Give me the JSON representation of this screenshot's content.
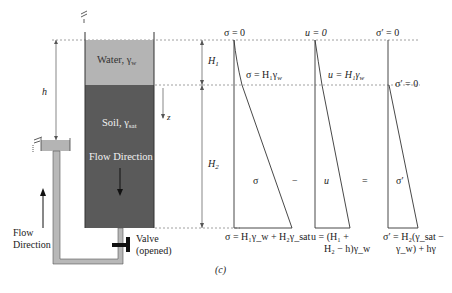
{
  "figure": {
    "caption": "(c)",
    "tank": {
      "water_label": "Water, γ",
      "water_sub": "w",
      "soil_label": "Soil, γ",
      "soil_sub": "sat",
      "inner_flow_label": "Flow Direction"
    },
    "outer_flow_label_1": "Flow",
    "outer_flow_label_2": "Direction",
    "valve_label_1": "Valve",
    "valve_label_2": "(opened)",
    "dimensions": {
      "h": "h",
      "H1": "H",
      "H1_sub": "1",
      "H2": "H",
      "H2_sub": "2",
      "z": "z"
    },
    "colors": {
      "water": "#b4b4b4",
      "soil": "#5a5a5a",
      "pipe": "#b8b8b8",
      "lines": "#333333"
    }
  },
  "diagrams": {
    "sigma": {
      "top": "σ = 0",
      "mid": "σ = H₁γ",
      "mid_sub": "w",
      "center": "σ",
      "bottom": "σ = H₁γ_w + H₂γ_sat"
    },
    "minus": "−",
    "u": {
      "top": "u = 0",
      "mid": "u = H₁γ",
      "mid_sub": "w",
      "center": "u",
      "bottom_1": "u = (H₁ +",
      "bottom_2": "H₂ − h)γ_w"
    },
    "equals": "=",
    "sigma_eff": {
      "top": "σ′ = 0",
      "mid": "σ′ = 0",
      "center": "σ′",
      "bottom_1": "σ′ = H₂(γ_sat −",
      "bottom_2": "γ_w) + hγ"
    }
  }
}
